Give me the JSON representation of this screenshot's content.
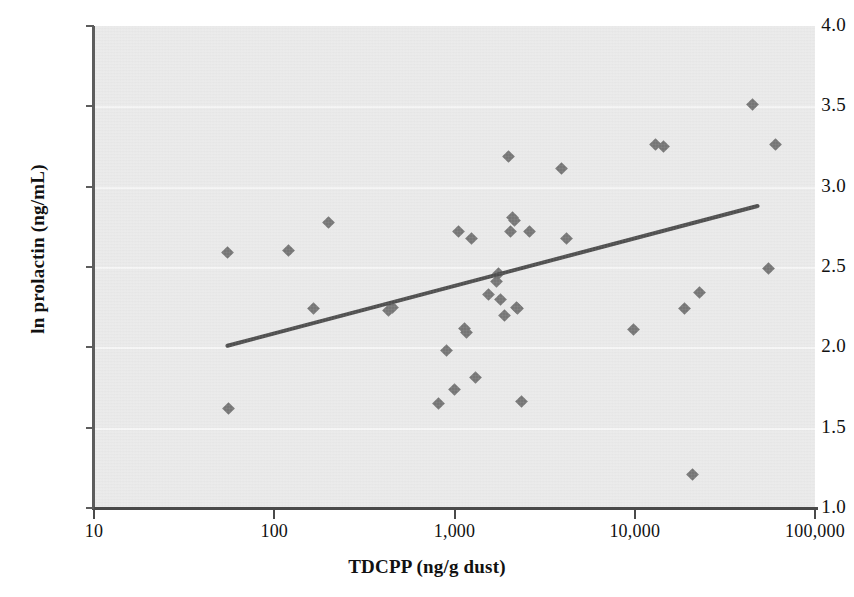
{
  "chart_data": {
    "type": "scatter",
    "title": "",
    "xlabel": "TDCPP (ng/g dust)",
    "ylabel": "ln prolactin (ng/mL)",
    "xscale": "log",
    "yscale": "linear",
    "xlim": [
      10,
      100000
    ],
    "ylim": [
      1.0,
      4.0
    ],
    "xticks": [
      10,
      100,
      1000,
      10000,
      100000
    ],
    "xticklabels": [
      "10",
      "100",
      "1,000",
      "10,000",
      "100,000"
    ],
    "yticks": [
      1.0,
      1.5,
      2.0,
      2.5,
      3.0,
      3.5,
      4.0
    ],
    "yticklabels": [
      "1.0",
      "1.5",
      "2.0",
      "2.5",
      "3.0",
      "3.5",
      "4.0"
    ],
    "grid": "horizontal",
    "legend": "none",
    "marker": "diamond",
    "marker_color": "#5b5b5b",
    "plot_background": "#e8e8e8",
    "points": [
      {
        "x": 55,
        "y": 2.59
      },
      {
        "x": 56,
        "y": 1.62
      },
      {
        "x": 120,
        "y": 2.6
      },
      {
        "x": 165,
        "y": 2.24
      },
      {
        "x": 200,
        "y": 2.78
      },
      {
        "x": 430,
        "y": 2.23
      },
      {
        "x": 455,
        "y": 2.25
      },
      {
        "x": 820,
        "y": 1.65
      },
      {
        "x": 900,
        "y": 1.98
      },
      {
        "x": 1000,
        "y": 1.74
      },
      {
        "x": 1050,
        "y": 2.72
      },
      {
        "x": 1130,
        "y": 2.12
      },
      {
        "x": 1160,
        "y": 2.09
      },
      {
        "x": 1250,
        "y": 2.68
      },
      {
        "x": 1300,
        "y": 1.81
      },
      {
        "x": 1550,
        "y": 2.33
      },
      {
        "x": 1700,
        "y": 2.41
      },
      {
        "x": 1760,
        "y": 2.46
      },
      {
        "x": 1800,
        "y": 2.3
      },
      {
        "x": 1900,
        "y": 2.2
      },
      {
        "x": 2000,
        "y": 3.19
      },
      {
        "x": 2050,
        "y": 2.72
      },
      {
        "x": 2100,
        "y": 2.81
      },
      {
        "x": 2150,
        "y": 2.79
      },
      {
        "x": 2200,
        "y": 2.25
      },
      {
        "x": 2250,
        "y": 2.24
      },
      {
        "x": 2350,
        "y": 1.66
      },
      {
        "x": 2600,
        "y": 2.72
      },
      {
        "x": 3900,
        "y": 3.11
      },
      {
        "x": 4200,
        "y": 2.68
      },
      {
        "x": 9800,
        "y": 2.11
      },
      {
        "x": 13000,
        "y": 3.26
      },
      {
        "x": 14500,
        "y": 3.25
      },
      {
        "x": 19000,
        "y": 2.24
      },
      {
        "x": 21000,
        "y": 1.21
      },
      {
        "x": 23000,
        "y": 2.34
      },
      {
        "x": 45000,
        "y": 3.51
      },
      {
        "x": 55000,
        "y": 2.49
      },
      {
        "x": 60000,
        "y": 3.26
      }
    ],
    "trendline": {
      "type": "linear-fit-on-log-x",
      "x_start": 55,
      "y_start": 2.01,
      "x_end": 48000,
      "y_end": 2.88,
      "color": "#2b2b2b"
    }
  }
}
